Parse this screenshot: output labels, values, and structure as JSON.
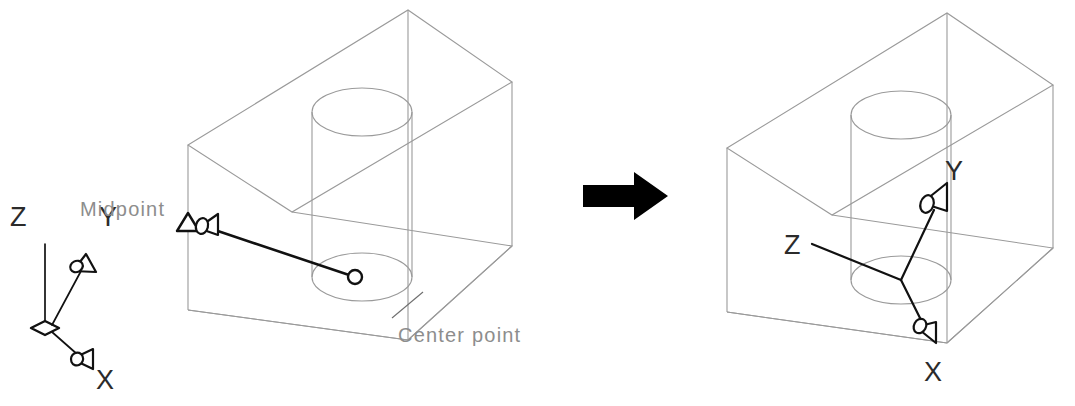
{
  "figure": {
    "background_color": "#ffffff",
    "wireframe_color": "#9a9a9a",
    "annotation_color": "#8d8d8d",
    "axis_color": "#111111"
  },
  "left_ucs_icon": {
    "name": "world-ucs-icon",
    "labels": {
      "z": "Z",
      "y": "Y",
      "x": "X"
    }
  },
  "middle_figure": {
    "name": "box-with-cylinder-before",
    "annotations": {
      "midpoint": "Midpoint",
      "center_point": "Center point"
    }
  },
  "transition": {
    "arrow_icon": "right-arrow-icon"
  },
  "right_figure": {
    "name": "box-with-cylinder-after",
    "labels": {
      "z": "Z",
      "y": "Y",
      "x": "X"
    }
  }
}
